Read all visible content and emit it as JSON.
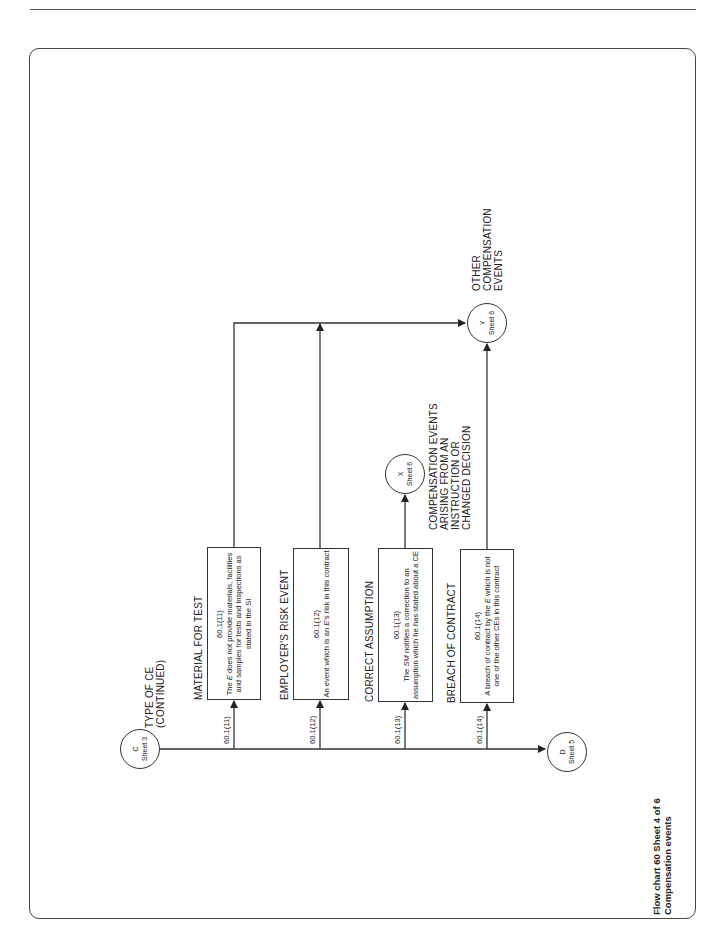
{
  "page": {
    "caption_line1": "Flow chart 60 Sheet 4 of 6",
    "caption_line2": "Compensation events"
  },
  "connectors": {
    "c": {
      "letter": "C",
      "sheet": "Sheet 3",
      "label_line1": "TYPE OF CE",
      "label_line2": "(CONTINUED)"
    },
    "d": {
      "letter": "D",
      "sheet": "Sheet 5"
    },
    "x": {
      "letter": "X",
      "sheet": "Sheet 6",
      "label_line1": "COMPENSATION EVENTS",
      "label_line2": "ARISING FROM AN",
      "label_line3": "INSTRUCTION OR",
      "label_line4": "CHANGED DECISION"
    },
    "y": {
      "letter": "Y",
      "sheet": "Sheet 6",
      "label_line1": "OTHER",
      "label_line2": "COMPENSATION",
      "label_line3": "EVENTS"
    }
  },
  "branches": [
    {
      "clause_label": "60.1(11)",
      "heading": "MATERIAL FOR TEST",
      "clause": "60.1(11)",
      "text_pre": "The ",
      "text_em": "E",
      "text_post": " does not provide materials, facilities and samples for tests and inspections as stated in the SI"
    },
    {
      "clause_label": "60.1(12)",
      "heading": "EMPLOYER'S RISK EVENT",
      "clause": "60.1(12)",
      "text_pre": "An event which is an ",
      "text_em": "E",
      "text_post": "'s risk in this contract"
    },
    {
      "clause_label": "60.1(13)",
      "heading": "CORRECT ASSUMPTION",
      "clause": "60.1(13)",
      "text_pre": "The ",
      "text_em": "SM",
      "text_post": " notifies a correction to an assumption which he has stated about a CE"
    },
    {
      "clause_label": "60.1(14)",
      "heading": "BREACH OF CONTRACT",
      "clause": "60.1(14)",
      "text_pre": "A breach of contract by the ",
      "text_em": "E",
      "text_post": " which is not one of the other CEs in this contract"
    }
  ]
}
